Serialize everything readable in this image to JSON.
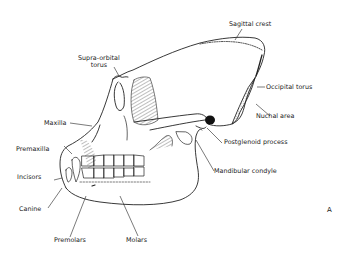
{
  "figure": {
    "panel_letter": "A",
    "labels": {
      "sagittal_crest": "Sagittal crest",
      "supra_orbital_torus_line1": "Supra-orbital",
      "supra_orbital_torus_line2": "torus",
      "occipital_torus": "Occipital torus",
      "nuchal_area": "Nuchal area",
      "maxilla": "Maxilla",
      "postglenoid_process": "Postglenoid process",
      "premaxilla": "Premaxilla",
      "incisors": "Incisors",
      "mandibular_condyle": "Mandibular condyle",
      "canine": "Canine",
      "premolars": "Premolars",
      "molars": "Molars"
    }
  }
}
